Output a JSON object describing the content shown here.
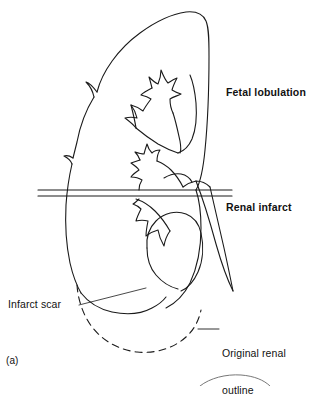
{
  "figure": {
    "panel_label": "(a)"
  },
  "annotations": {
    "fetal_lobulation": {
      "text": "Fetal lobulation",
      "weight": "bold",
      "points_to": "upper-lateral-kidney-border"
    },
    "renal_infarct": {
      "text": "Renal infarct",
      "weight": "bold",
      "points_to": "infarct-level-lines"
    },
    "infarct_scar": {
      "text": "Infarct scar",
      "weight": "regular",
      "points_to": "lower-pole-scar-curve"
    },
    "original_renal_outline": {
      "line1": "Original renal",
      "line2": "outline",
      "weight": "regular",
      "points_to": "dashed-lower-pole-outline"
    }
  },
  "graphics": {
    "stroke_color": "#1a1a1a",
    "background_color": "#ffffff",
    "line_width": 1.1,
    "dash_pattern": "7 5",
    "elements": [
      "kidney-outline",
      "fetal-lobulation-notch-upper",
      "fetal-lobulation-notch-lower",
      "infarct-level-line-top",
      "infarct-level-line-bottom",
      "upper-calyx",
      "middle-calyx",
      "lower-calyx",
      "renal-pelvis",
      "ureter",
      "infarct-scar-curve",
      "original-outline-dashed",
      "leader-line-infarct-scar",
      "leader-line-original-outline",
      "next-panel-arc"
    ]
  }
}
